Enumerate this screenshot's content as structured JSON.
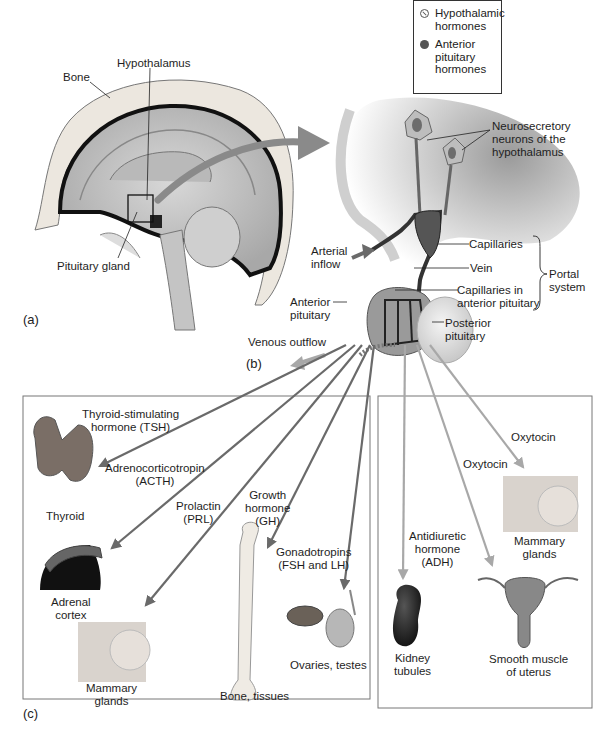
{
  "legend": {
    "items": [
      {
        "symbol": "hypothalamic-hormone-symbol",
        "label": "Hypothalamic\nhormones"
      },
      {
        "symbol": "anterior-pituitary-hormone-symbol",
        "label": "Anterior\npituitary\nhormones"
      }
    ]
  },
  "panel_a": {
    "letter": "(a)",
    "labels": {
      "bone": "Bone",
      "hypothalamus": "Hypothalamus",
      "pituitary_gland": "Pituitary gland"
    }
  },
  "panel_b": {
    "letter": "(b)",
    "labels": {
      "neurons": "Neurosecretory\nneurons of the\nhypothalamus",
      "arterial_inflow": "Arterial\ninflow",
      "capillaries": "Capillaries",
      "vein": "Vein",
      "capillaries_anterior": "Capillaries in\nanterior pituitary",
      "portal_system": "Portal\nsystem",
      "anterior_pituitary": "Anterior\npituitary",
      "posterior_pituitary": "Posterior\npituitary",
      "venous_outflow": "Venous outflow"
    }
  },
  "panel_c": {
    "letter": "(c)",
    "anterior_box": {
      "hormones": {
        "tsh": "Thyroid-stimulating\nhormone (TSH)",
        "acth": "Adrenocorticotropin\n(ACTH)",
        "prl": "Prolactin\n(PRL)",
        "gh": "Growth\nhormone\n(GH)",
        "gonadotropins": "Gonadotropins\n(FSH and LH)"
      },
      "targets": {
        "thyroid": "Thyroid",
        "adrenal": "Adrenal\ncortex",
        "mammary": "Mammary\nglands",
        "bone": "Bone, tissues",
        "ovaries": "Ovaries, testes"
      }
    },
    "posterior_box": {
      "hormones": {
        "adh": "Antidiuretic\nhormone\n(ADH)",
        "oxytocin_uterus": "Oxytocin",
        "oxytocin_mammary": "Oxytocin"
      },
      "targets": {
        "kidney": "Kidney\ntubules",
        "uterus": "Smooth muscle\nof uterus",
        "mammary": "Mammary\nglands"
      }
    }
  },
  "colors": {
    "anterior_arrow": "#6a6a6a",
    "posterior_arrow": "#a8a8a8",
    "box_border": "#777777"
  }
}
